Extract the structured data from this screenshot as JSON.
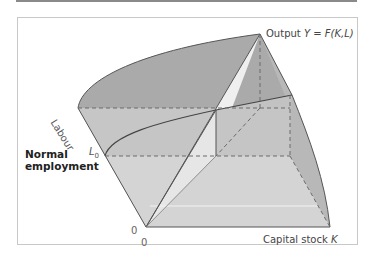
{
  "figure": {
    "type": "3d production function surface",
    "labels": {
      "output_prefix": "Output ",
      "output_var": "Y",
      "output_eq": " = ",
      "output_func": "F(K,L)",
      "capital_prefix": "Capital stock ",
      "capital_var": "K",
      "labour_axis": "Labour",
      "normal_employment": "Normal employment",
      "l0_var": "L",
      "l0_sub": "0",
      "origin_labour": "0",
      "origin_capital": "0"
    },
    "colors": {
      "surface_dark": "#a9a9a9",
      "surface_mid": "#c4c4c4",
      "surface_light": "#d6d6d6",
      "slice_white": "#efefef",
      "line": "#555555",
      "dash": "#6a6a6a",
      "frame": "#c8c8c8",
      "rule": "#8a8a8a"
    }
  }
}
